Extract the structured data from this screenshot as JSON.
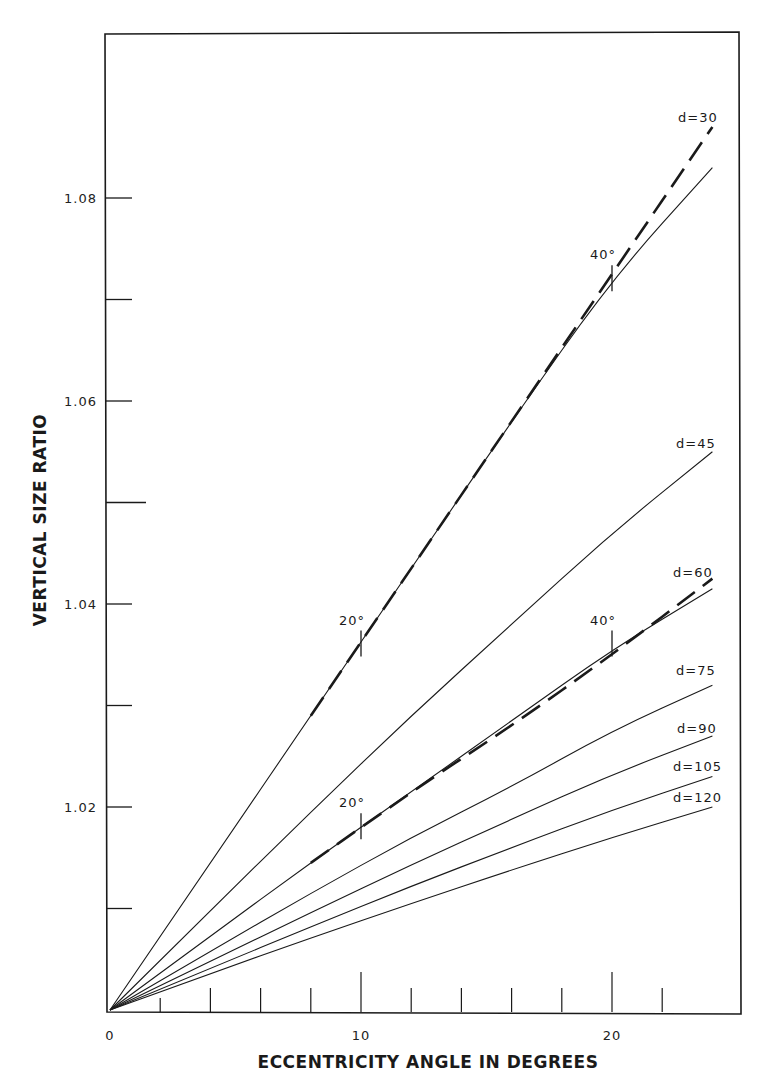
{
  "chart_data": {
    "type": "line",
    "title": "",
    "xlabel": "ECCENTRICITY ANGLE IN DEGREES",
    "ylabel": "VERTICAL SIZE RATIO",
    "xlim": [
      0,
      25
    ],
    "ylim": [
      1.0,
      1.097
    ],
    "x_ticks_labeled": [
      {
        "value": 0,
        "label": "0"
      },
      {
        "value": 10,
        "label": "10"
      },
      {
        "value": 20,
        "label": "20"
      }
    ],
    "x_ticks_minor": [
      2,
      4,
      6,
      8,
      12,
      14,
      16,
      18,
      22
    ],
    "y_ticks_labeled": [
      {
        "value": 1.02,
        "label": "1.02"
      },
      {
        "value": 1.04,
        "label": "1.04"
      },
      {
        "value": 1.06,
        "label": "1.06"
      },
      {
        "value": 1.08,
        "label": "1.08"
      }
    ],
    "y_ticks_minor": [
      1.01,
      1.03,
      1.05,
      1.07
    ],
    "grid": false,
    "legend": "inline labels at right end of each curve",
    "x": [
      0,
      4,
      8,
      12,
      16,
      20,
      24
    ],
    "series": [
      {
        "name": "d=30",
        "label": "d=30",
        "style": "solid",
        "values": [
          1.0,
          1.0145,
          1.029,
          1.0435,
          1.058,
          1.072,
          1.083
        ]
      },
      {
        "name": "d=30 (dashed)",
        "label": "",
        "style": "dashed",
        "values": [
          null,
          null,
          1.029,
          1.0435,
          1.058,
          1.0725,
          1.087
        ]
      },
      {
        "name": "d=45",
        "label": "d=45",
        "style": "solid",
        "values": [
          1.0,
          1.0098,
          1.0195,
          1.029,
          1.038,
          1.047,
          1.055
        ]
      },
      {
        "name": "d=60",
        "label": "d=60",
        "style": "solid",
        "values": [
          1.0,
          1.0073,
          1.0145,
          1.0215,
          1.0285,
          1.0355,
          1.0415
        ]
      },
      {
        "name": "d=60 (dashed)",
        "label": "",
        "style": "dashed",
        "values": [
          null,
          null,
          1.0145,
          1.0215,
          1.028,
          1.035,
          1.0425
        ]
      },
      {
        "name": "d=75",
        "label": "d=75",
        "style": "solid",
        "values": [
          1.0,
          1.0058,
          1.0115,
          1.017,
          1.022,
          1.0275,
          1.032
        ]
      },
      {
        "name": "d=90",
        "label": "d=90",
        "style": "solid",
        "values": [
          1.0,
          1.0048,
          1.0096,
          1.0143,
          1.0188,
          1.0232,
          1.027
        ]
      },
      {
        "name": "d=105",
        "label": "d=105",
        "style": "solid",
        "values": [
          1.0,
          1.0041,
          1.0082,
          1.0122,
          1.016,
          1.0197,
          1.023
        ]
      },
      {
        "name": "d=120",
        "label": "d=120",
        "style": "solid",
        "values": [
          1.0,
          1.0036,
          1.0071,
          1.0105,
          1.0138,
          1.017,
          1.02
        ]
      }
    ],
    "annotations": [
      {
        "text": "20°",
        "x": 10,
        "y": 1.036,
        "on": "d=30"
      },
      {
        "text": "40°",
        "x": 20,
        "y": 1.072,
        "on": "d=30"
      },
      {
        "text": "20°",
        "x": 10,
        "y": 1.018,
        "on": "d=60"
      },
      {
        "text": "40°",
        "x": 20,
        "y": 1.036,
        "on": "d=60"
      }
    ]
  },
  "colors": {
    "ink": "#1a1a1a",
    "background": "#ffffff"
  }
}
